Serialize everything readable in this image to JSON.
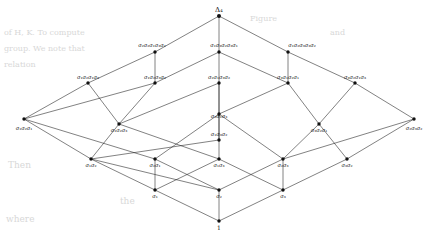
{
  "figure": {
    "top_node": {
      "id": "top",
      "label": "Δ",
      "sub": "4"
    },
    "bottom_node": {
      "id": "bottom",
      "label": "1",
      "sub": ""
    },
    "ink_color": "#111111",
    "background_color": "#ffffff"
  },
  "nodes": [
    {
      "id": "n0",
      "label": "1",
      "level": 0,
      "x": 219,
      "y": 221,
      "label_dx": 0,
      "label_dy": 9,
      "anchor": "middle"
    },
    {
      "id": "n1",
      "label": "σ₁",
      "level": 1,
      "x": 155,
      "y": 190,
      "label_dx": 0,
      "label_dy": 8,
      "anchor": "middle"
    },
    {
      "id": "n2",
      "label": "σ₂",
      "level": 1,
      "x": 219,
      "y": 190,
      "label_dx": 0,
      "label_dy": 8,
      "anchor": "middle"
    },
    {
      "id": "n3",
      "label": "σ₃",
      "level": 1,
      "x": 283,
      "y": 190,
      "label_dx": 0,
      "label_dy": 8,
      "anchor": "middle"
    },
    {
      "id": "n4",
      "label": "σ₁σ₂",
      "level": 2,
      "x": 91,
      "y": 159,
      "label_dx": 0,
      "label_dy": 8,
      "anchor": "middle"
    },
    {
      "id": "n5",
      "label": "σ₂σ₁",
      "level": 2,
      "x": 155,
      "y": 159,
      "label_dx": 0,
      "label_dy": 8,
      "anchor": "middle"
    },
    {
      "id": "n6",
      "label": "σ₁σ₃",
      "level": 2,
      "x": 219,
      "y": 159,
      "label_dx": 0,
      "label_dy": 8,
      "anchor": "middle"
    },
    {
      "id": "n7",
      "label": "σ₂σ₃",
      "level": 2,
      "x": 283,
      "y": 159,
      "label_dx": 0,
      "label_dy": 8,
      "anchor": "middle"
    },
    {
      "id": "n8",
      "label": "σ₃σ₂",
      "level": 2,
      "x": 347,
      "y": 159,
      "label_dx": 0,
      "label_dy": 8,
      "anchor": "middle"
    },
    {
      "id": "n9",
      "label": "σ₁σ₂σ₁",
      "level": 3,
      "x": 24,
      "y": 119,
      "label_dx": 0,
      "label_dy": 11,
      "anchor": "middle"
    },
    {
      "id": "n10",
      "label": "σ₁σ₂σ₃",
      "level": 3,
      "x": 119,
      "y": 124,
      "label_dx": 0,
      "label_dy": 8,
      "anchor": "middle"
    },
    {
      "id": "n11",
      "label": "σ₂σ₁σ₃",
      "level": 3,
      "x": 219,
      "y": 114,
      "label_dx": 0,
      "label_dy": 4,
      "anchor": "middle"
    },
    {
      "id": "n12",
      "label": "σ₁σ₃σ₂",
      "level": 3,
      "x": 219,
      "y": 140,
      "label_dx": 0,
      "label_dy": -4,
      "anchor": "middle"
    },
    {
      "id": "n13",
      "label": "σ₃σ₂σ₁",
      "level": 3,
      "x": 319,
      "y": 124,
      "label_dx": 0,
      "label_dy": 8,
      "anchor": "middle"
    },
    {
      "id": "n14",
      "label": "σ₂σ₃σ₂",
      "level": 3,
      "x": 414,
      "y": 119,
      "label_dx": 0,
      "label_dy": 11,
      "anchor": "middle"
    },
    {
      "id": "n15",
      "label": "σ₁σ₂σ₁σ₃",
      "level": 4,
      "x": 88,
      "y": 83,
      "label_dx": 0,
      "label_dy": -4,
      "anchor": "middle"
    },
    {
      "id": "n16",
      "label": "σ₁σ₂σ₃σ₂",
      "level": 4,
      "x": 155,
      "y": 83,
      "label_dx": 0,
      "label_dy": -4,
      "anchor": "middle"
    },
    {
      "id": "n17",
      "label": "σ₂σ₁σ₃σ₂",
      "level": 4,
      "x": 219,
      "y": 83,
      "label_dx": 0,
      "label_dy": -4,
      "anchor": "middle"
    },
    {
      "id": "n18",
      "label": "σ₃σ₁σ₂σ₁",
      "level": 4,
      "x": 288,
      "y": 83,
      "label_dx": 0,
      "label_dy": -4,
      "anchor": "middle"
    },
    {
      "id": "n19",
      "label": "σ₃σ₂σ₁σ₃",
      "level": 4,
      "x": 355,
      "y": 83,
      "label_dx": 0,
      "label_dy": -4,
      "anchor": "middle"
    },
    {
      "id": "n20",
      "label": "σ₂σ₂σ₁σ₃σ₂",
      "level": 5,
      "x": 155,
      "y": 52,
      "label_dx": -3,
      "label_dy": -5,
      "anchor": "middle"
    },
    {
      "id": "n21",
      "label": "σ₁σ₃σ₂σ₃σ₁",
      "level": 5,
      "x": 219,
      "y": 52,
      "label_dx": 5,
      "label_dy": -5,
      "anchor": "middle"
    },
    {
      "id": "n22",
      "label": "σ₁σ₂σ₃σ₃σ₂",
      "level": 5,
      "x": 288,
      "y": 52,
      "label_dx": 14,
      "label_dy": -5,
      "anchor": "middle"
    },
    {
      "id": "n23",
      "label": "Δ₄",
      "level": 6,
      "x": 219,
      "y": 16,
      "label_dx": 0,
      "label_dy": -4,
      "anchor": "middle"
    }
  ],
  "edges": [
    {
      "from": "n0",
      "to": "n1"
    },
    {
      "from": "n0",
      "to": "n2"
    },
    {
      "from": "n0",
      "to": "n3"
    },
    {
      "from": "n1",
      "to": "n4"
    },
    {
      "from": "n1",
      "to": "n5"
    },
    {
      "from": "n1",
      "to": "n6"
    },
    {
      "from": "n2",
      "to": "n4"
    },
    {
      "from": "n2",
      "to": "n5"
    },
    {
      "from": "n2",
      "to": "n7"
    },
    {
      "from": "n3",
      "to": "n6"
    },
    {
      "from": "n3",
      "to": "n7"
    },
    {
      "from": "n3",
      "to": "n8"
    },
    {
      "from": "n4",
      "to": "n9"
    },
    {
      "from": "n4",
      "to": "n10"
    },
    {
      "from": "n5",
      "to": "n9"
    },
    {
      "from": "n5",
      "to": "n11"
    },
    {
      "from": "n6",
      "to": "n10"
    },
    {
      "from": "n6",
      "to": "n12"
    },
    {
      "from": "n7",
      "to": "n11"
    },
    {
      "from": "n7",
      "to": "n13"
    },
    {
      "from": "n8",
      "to": "n13"
    },
    {
      "from": "n8",
      "to": "n14"
    },
    {
      "from": "n4",
      "to": "n12"
    },
    {
      "from": "n7",
      "to": "n14"
    },
    {
      "from": "n9",
      "to": "n15"
    },
    {
      "from": "n9",
      "to": "n16"
    },
    {
      "from": "n10",
      "to": "n15"
    },
    {
      "from": "n10",
      "to": "n16"
    },
    {
      "from": "n11",
      "to": "n17"
    },
    {
      "from": "n11",
      "to": "n18"
    },
    {
      "from": "n12",
      "to": "n17"
    },
    {
      "from": "n13",
      "to": "n18"
    },
    {
      "from": "n13",
      "to": "n19"
    },
    {
      "from": "n14",
      "to": "n19"
    },
    {
      "from": "n10",
      "to": "n17"
    },
    {
      "from": "n12",
      "to": "n11"
    },
    {
      "from": "n15",
      "to": "n20"
    },
    {
      "from": "n16",
      "to": "n20"
    },
    {
      "from": "n16",
      "to": "n21"
    },
    {
      "from": "n17",
      "to": "n21"
    },
    {
      "from": "n18",
      "to": "n21"
    },
    {
      "from": "n18",
      "to": "n22"
    },
    {
      "from": "n19",
      "to": "n22"
    },
    {
      "from": "n20",
      "to": "n23"
    },
    {
      "from": "n21",
      "to": "n23"
    },
    {
      "from": "n22",
      "to": "n23"
    }
  ],
  "background_text": [
    {
      "text": "of H, K. To compute",
      "x": 4,
      "y": 28,
      "size": 8
    },
    {
      "text": "group. We note that",
      "x": 4,
      "y": 44,
      "size": 8
    },
    {
      "text": "relation",
      "x": 4,
      "y": 60,
      "size": 8
    },
    {
      "text": "Figure",
      "x": 250,
      "y": 14,
      "size": 8
    },
    {
      "text": "and",
      "x": 330,
      "y": 28,
      "size": 8
    },
    {
      "text": "Then",
      "x": 8,
      "y": 160,
      "size": 9
    },
    {
      "text": "the",
      "x": 120,
      "y": 196,
      "size": 9
    },
    {
      "text": "where",
      "x": 6,
      "y": 214,
      "size": 9
    }
  ]
}
